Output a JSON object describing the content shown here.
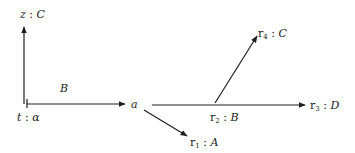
{
  "diagram": {
    "nodes": {
      "z": {
        "name": "z",
        "sep": " : ",
        "type": "C"
      },
      "t": {
        "name": "t",
        "sep": " : ",
        "type": "α"
      },
      "a": {
        "name": "a"
      },
      "r1": {
        "name": "r",
        "sub": "1",
        "sep": " : ",
        "type": "A"
      },
      "r2": {
        "name": "r",
        "sub": "2",
        "sep": " : ",
        "type": "B"
      },
      "r3": {
        "name": "r",
        "sub": "3",
        "sep": " : ",
        "type": "D"
      },
      "r4": {
        "name": "r",
        "sub": "4",
        "sep": " : ",
        "type": "C"
      }
    },
    "edge_labels": {
      "t_to_a": "B"
    },
    "edges": [
      {
        "from": "t",
        "to": "z",
        "label": ""
      },
      {
        "from": "t",
        "to": "a",
        "label": "B"
      },
      {
        "from": "a",
        "to": "r1",
        "label": ""
      },
      {
        "from": "a",
        "to": "r3",
        "label": ""
      },
      {
        "from": "r2",
        "to": "r4",
        "label": ""
      }
    ]
  }
}
